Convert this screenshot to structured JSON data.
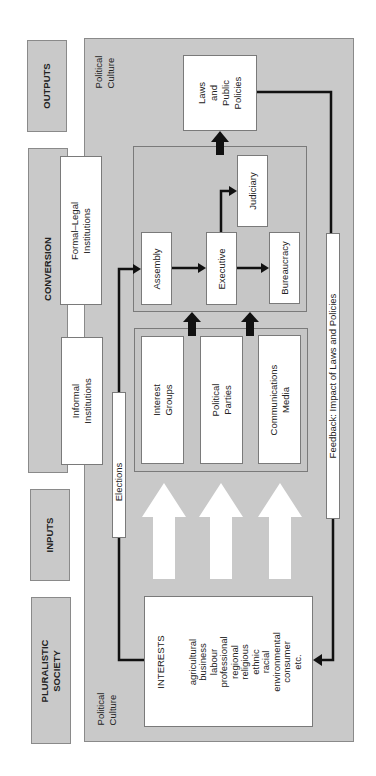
{
  "stages": {
    "outputs": "OUTPUTS",
    "conversion": "CONVERSION",
    "inputs": "INPUTS",
    "pluralistic_society": "PLURALISTIC\nSOCIETY"
  },
  "political_culture_top": "Political\nCulture",
  "political_culture_bottom": "Political\nCulture",
  "institutions": {
    "formal_legal": "Formal–Legal\nInstitutions",
    "informal": "Informal\nInstitutions"
  },
  "government": {
    "assembly": "Assembly",
    "executive": "Executive",
    "judiciary": "Judiciary",
    "bureaucracy": "Bureaucracy"
  },
  "intermediaries": {
    "interest_groups": "Interest\nGroups",
    "political_parties": "Political\nParties",
    "communications_media": "Communications\nMedia"
  },
  "input_flows": {
    "demands": "Demands",
    "expectations": "Expectations",
    "supports": "Supports"
  },
  "elections": "Elections",
  "outputs_box": "Laws\nand\nPublic\nPolicies",
  "feedback": "Feedback: Impact of Laws and Policies",
  "interests": {
    "title": "INTERESTS",
    "items": "agricultural\nbusiness\nlabour\nprofessional\nregional\nreligious\nethnic\nracial\nenvironmental\nconsumer\netc."
  },
  "colors": {
    "panel_grey": "#c9c9c9",
    "box_white": "#ffffff",
    "arrow_black": "#111111"
  }
}
